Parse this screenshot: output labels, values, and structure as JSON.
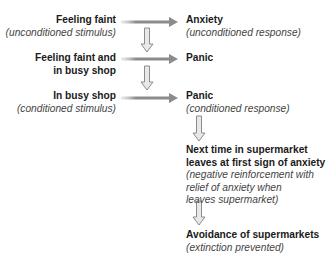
{
  "diagram": {
    "left": [
      {
        "title": "Feeling faint",
        "subtitle": "(unconditioned stimulus)"
      },
      {
        "title_lines": [
          "Feeling faint and",
          "in busy shop"
        ]
      },
      {
        "title": "In busy shop",
        "subtitle": "(conditioned stimulus)"
      }
    ],
    "right": [
      {
        "title": "Anxiety",
        "subtitle": "(unconditioned response)"
      },
      {
        "title": "Panic"
      },
      {
        "title": "Panic",
        "subtitle": "(conditioned response)"
      },
      {
        "title_lines": [
          "Next time in supermarket",
          "leaves at first sign of anxiety"
        ],
        "subtitle_lines": [
          "(negative reinforcement with",
          "relief of anxiety when",
          "leaves supermarket)"
        ]
      },
      {
        "title": "Avoidance of supermarkets",
        "subtitle": "(extinction prevented)"
      }
    ],
    "colors": {
      "arrow": "#8c8c8c",
      "arrow_fill": "#dcdcdc",
      "text": "#1a1a1a",
      "subtext": "#444444"
    }
  }
}
